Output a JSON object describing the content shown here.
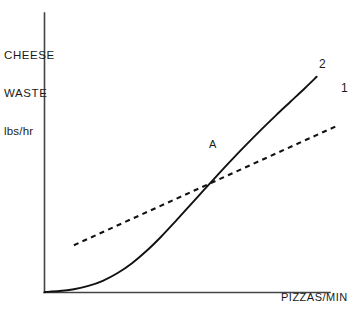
{
  "chart_data": {
    "type": "line",
    "title": "",
    "subtitle": "",
    "ylabel_lines": [
      "CHEESE",
      "WASTE",
      "lbs/hr"
    ],
    "ylabel": "CHEESE WASTE lbs/hr",
    "xlabel": "PIZZAS/MIN",
    "grid": false,
    "legend_position": "inline-right-end-of-curve",
    "axis_style": "open-L-axes-no-ticks",
    "xlim": [
      0,
      100
    ],
    "ylim": [
      0,
      100
    ],
    "x_tick_labels": [],
    "y_tick_labels": [],
    "annotations": [
      {
        "text": "A",
        "meaning": "intersection-of-curve-1-and-curve-2",
        "x": 60,
        "y": 51
      }
    ],
    "series": [
      {
        "name": "2",
        "label": "2",
        "style": "solid",
        "color": "#111111",
        "description": "S-shaped curve rising slowly from origin then steepening",
        "x": [
          0,
          5,
          10,
          15,
          20,
          25,
          30,
          35,
          40,
          45,
          50,
          55,
          60,
          65,
          70,
          75,
          80,
          85,
          90,
          94
        ],
        "y": [
          0,
          0.4,
          1.2,
          2.6,
          4.8,
          8.0,
          12.2,
          17.4,
          23.4,
          30.0,
          36.8,
          43.6,
          50.4,
          57.0,
          63.4,
          69.6,
          75.6,
          81.4,
          87.2,
          92.0
        ]
      },
      {
        "name": "1",
        "label": "1",
        "style": "dashed",
        "color": "#111111",
        "description": "Straight dashed line of shallower slope crossing curve 2 at A",
        "x": [
          10,
          101
        ],
        "y": [
          20,
          71
        ]
      }
    ]
  },
  "labels": {
    "curve_two": "2",
    "curve_one": "1",
    "point_a": "A"
  },
  "axes": {
    "x_title": "PIZZAS/MIN",
    "y_title_line1": "CHEESE",
    "y_title_line2": "WASTE",
    "y_title_line3": "lbs/hr"
  }
}
